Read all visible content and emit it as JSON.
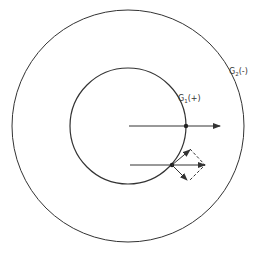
{
  "diagram": {
    "outer_circle": {
      "label_main": "G",
      "label_sub": "2",
      "label_sign": "(-)",
      "cx": 128,
      "cy": 126,
      "r": 116
    },
    "inner_circle": {
      "label_main": "G",
      "label_sub": "1",
      "label_sign": "(+)",
      "cx": 128,
      "cy": 126,
      "r": 58
    },
    "arrows": [
      {
        "name": "upper-arrow",
        "x1": 129,
        "y1": 126,
        "x2": 220,
        "y2": 126,
        "point": [
          186,
          126
        ]
      },
      {
        "name": "lower-arrow",
        "x1": 130,
        "y1": 165,
        "x2": 205,
        "y2": 165,
        "point": [
          172,
          165
        ]
      }
    ],
    "components": {
      "tangent": {
        "x2": 191,
        "y2": 149
      },
      "normal": {
        "x2": 188,
        "y2": 181
      }
    },
    "colors": {
      "stroke": "#333333",
      "background": "#ffffff"
    }
  }
}
